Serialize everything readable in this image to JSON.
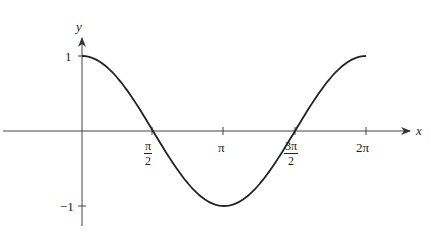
{
  "chart_data": {
    "type": "line",
    "title": "",
    "function": "y = cos(x)",
    "xlabel": "x",
    "ylabel": "y",
    "xlim": [
      0,
      6.2832
    ],
    "ylim": [
      -1,
      1
    ],
    "grid": false,
    "legend": null,
    "x_ticks": [
      {
        "value": 1.5708,
        "label": "π/2",
        "num": "π",
        "den": "2"
      },
      {
        "value": 3.1416,
        "label": "π"
      },
      {
        "value": 4.7124,
        "label": "3π/2",
        "num": "3π",
        "den": "2"
      },
      {
        "value": 6.2832,
        "label": "2π"
      }
    ],
    "y_ticks": [
      {
        "value": 1,
        "label": "1"
      },
      {
        "value": -1,
        "label": "−1"
      }
    ],
    "series": [
      {
        "name": "cos(x)",
        "x": [
          0,
          0.7854,
          1.5708,
          2.3562,
          3.1416,
          3.927,
          4.7124,
          5.4978,
          6.2832
        ],
        "values": [
          1,
          0.707,
          0,
          -0.707,
          -1,
          -0.707,
          0,
          0.707,
          1
        ]
      }
    ],
    "colors": {
      "axis": "#333333",
      "curve": "#222222",
      "background": "#ffffff"
    }
  },
  "labels": {
    "y_axis": "y",
    "x_axis": "x",
    "y_tick_pos": "1",
    "y_tick_neg": "−1",
    "x_tick_pi_half_num": "π",
    "x_tick_pi_half_den": "2",
    "x_tick_pi": "π",
    "x_tick_three_pi_half_num": "3π",
    "x_tick_three_pi_half_den": "2",
    "x_tick_two_pi": "2π"
  }
}
